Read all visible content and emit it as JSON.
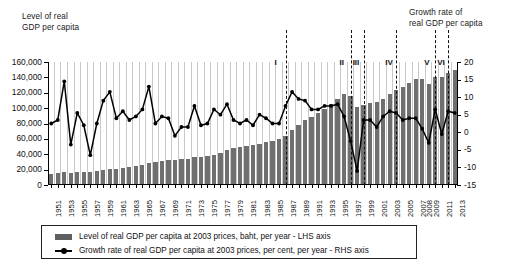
{
  "labels": {
    "lhs_axis_title": "Level of real\nGDP per capita",
    "rhs_axis_title": "Growth rate of\nreal GDP per capita"
  },
  "legend": {
    "bar_label": "Level of real GDP per capita at 2003 prices, baht, per year - LHS axis",
    "line_label": "Growth rate of real GDP per capita at 2003 prices, per cent, per year - RHS axis"
  },
  "period_markers": [
    {
      "label": "I",
      "year": 1987
    },
    {
      "label": "II",
      "year": 1997
    },
    {
      "label": "III",
      "year": 1999
    },
    {
      "label": "IV",
      "year": 2004
    },
    {
      "label": "V",
      "year": 2010
    },
    {
      "label": "VI",
      "year": 2012
    }
  ],
  "chart_data": {
    "type": "bar",
    "title": "",
    "subtitle": "",
    "xlabel": "",
    "ylabel": "Level of real GDP per capita",
    "y2label": "Growth rate of real GDP per capita",
    "ylim": [
      0,
      160000
    ],
    "y2lim": [
      -15,
      20
    ],
    "ytick_labels": [
      "0",
      "20,000",
      "40,000",
      "60,000",
      "80,000",
      "100,000",
      "120,000",
      "140,000",
      "160,000"
    ],
    "ytick_values": [
      0,
      20000,
      40000,
      60000,
      80000,
      100000,
      120000,
      140000,
      160000
    ],
    "y2tick_labels": [
      "-15",
      "-10",
      "-5",
      "0",
      "5",
      "10",
      "15",
      "20"
    ],
    "y2tick_values": [
      -15,
      -10,
      -5,
      0,
      5,
      10,
      15,
      20
    ],
    "grid": true,
    "legend_position": "bottom",
    "x": [
      1951,
      1952,
      1953,
      1954,
      1955,
      1956,
      1957,
      1958,
      1959,
      1960,
      1961,
      1962,
      1963,
      1964,
      1965,
      1966,
      1967,
      1968,
      1969,
      1970,
      1971,
      1972,
      1973,
      1974,
      1975,
      1976,
      1977,
      1978,
      1979,
      1980,
      1981,
      1982,
      1983,
      1984,
      1985,
      1986,
      1987,
      1988,
      1989,
      1990,
      1991,
      1992,
      1993,
      1994,
      1995,
      1996,
      1997,
      1998,
      1999,
      2000,
      2001,
      2002,
      2003,
      2004,
      2005,
      2006,
      2007,
      2008,
      2009,
      2010,
      2011,
      2012,
      2013
    ],
    "xtick_labels": [
      "1951",
      "1953",
      "1955",
      "1957",
      "1959",
      "1961",
      "1963",
      "1965",
      "1967",
      "1969",
      "1971",
      "1973",
      "1975",
      "1977",
      "1979",
      "1981",
      "1983",
      "1985",
      "1987",
      "1989",
      "1991",
      "1993",
      "1995",
      "1997",
      "1999",
      "2001",
      "2003",
      "2005",
      "2007",
      "2008",
      "2009",
      "2011",
      "2013"
    ],
    "series": [
      {
        "name": "Level of real GDP per capita at 2003 prices, baht, per year - LHS axis",
        "type": "bar",
        "axis": "left",
        "color": "#6f6f6f",
        "values": [
          14500,
          15000,
          16500,
          16000,
          17000,
          17500,
          17200,
          17800,
          19000,
          20500,
          21000,
          22000,
          23500,
          24500,
          26000,
          28500,
          29500,
          31000,
          32500,
          33000,
          33500,
          34000,
          36000,
          36500,
          37500,
          39500,
          42000,
          45000,
          47500,
          49000,
          50500,
          51500,
          54000,
          55500,
          57000,
          59500,
          63500,
          71000,
          78000,
          84000,
          89000,
          93500,
          99000,
          105000,
          112000,
          118000,
          115500,
          102000,
          103500,
          107000,
          108000,
          112000,
          118000,
          124000,
          128000,
          133000,
          138000,
          138500,
          132000,
          140000,
          140500,
          146000,
          149000
        ]
      },
      {
        "name": "Growth rate of real GDP per capita at 2003 prices, per cent, per year - RHS axis",
        "type": "line",
        "axis": "right",
        "color": "#000000",
        "values": [
          2.5,
          3.5,
          14.5,
          -3.5,
          5.5,
          2.0,
          -6.5,
          2.5,
          9.0,
          11.5,
          4.0,
          6.0,
          3.5,
          4.5,
          6.5,
          13.0,
          2.5,
          4.5,
          4.0,
          -1.0,
          1.5,
          1.5,
          7.5,
          2.0,
          2.5,
          6.5,
          5.0,
          8.0,
          3.5,
          2.5,
          3.5,
          2.0,
          5.0,
          4.0,
          2.5,
          2.5,
          7.5,
          11.5,
          9.5,
          9.0,
          6.5,
          6.5,
          7.5,
          7.5,
          8.0,
          4.5,
          -2.5,
          -11.0,
          3.5,
          3.5,
          1.5,
          4.5,
          6.0,
          5.5,
          3.5,
          4.0,
          4.0,
          1.0,
          -3.0,
          6.5,
          -0.5,
          6.0,
          5.5
        ]
      }
    ]
  }
}
